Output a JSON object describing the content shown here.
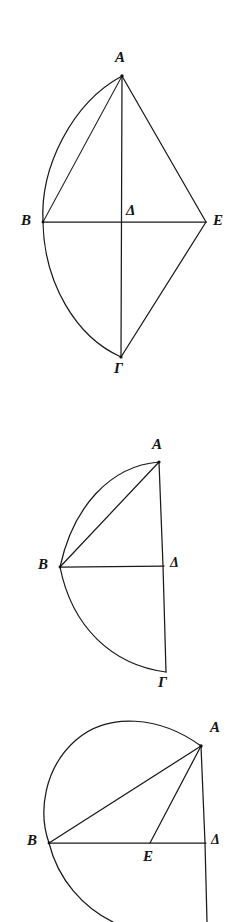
{
  "plate": {
    "background_color": "#ffffff",
    "ink_color": "#1a1a1a",
    "width": 243,
    "height": 922,
    "figure_count": 3
  },
  "figures": [
    {
      "id": "figure-1",
      "description": "Lens/kite construction: circular segment arc B-A and B-Gamma on the left, straight chords A-B, A-E, E-Gamma on the right, with horizontal diameter B-E and vertical axis A-Delta-Gamma crossing at Delta.",
      "labels": [
        {
          "key": "A",
          "text": "A",
          "x": 115,
          "y": 50
        },
        {
          "key": "B",
          "text": "B",
          "x": 21,
          "y": 213
        },
        {
          "key": "D",
          "text": "Δ",
          "x": 126,
          "y": 203
        },
        {
          "key": "E",
          "text": "E",
          "x": 213,
          "y": 213
        },
        {
          "key": "G",
          "text": "Γ",
          "x": 114,
          "y": 361
        }
      ],
      "points": {
        "A": {
          "x": 122,
          "y": 76
        },
        "B": {
          "x": 43,
          "y": 222
        },
        "D": {
          "x": 122,
          "y": 222
        },
        "E": {
          "x": 206,
          "y": 222
        },
        "G": {
          "x": 121,
          "y": 357
        }
      }
    },
    {
      "id": "figure-2",
      "description": "Right-hand half figure: arc sweeping from A leftwards through B down to Gamma, vertical line A-Delta-Gamma on the right, horizontal radius B-Delta, and chord B-A.",
      "labels": [
        {
          "key": "A",
          "text": "A",
          "x": 152,
          "y": 437
        },
        {
          "key": "B",
          "text": "B",
          "x": 38,
          "y": 557
        },
        {
          "key": "D",
          "text": "Δ",
          "x": 170,
          "y": 556
        },
        {
          "key": "G",
          "text": "Γ",
          "x": 158,
          "y": 675
        }
      ],
      "points": {
        "A": {
          "x": 159,
          "y": 462
        },
        "B": {
          "x": 60,
          "y": 567
        },
        "D": {
          "x": 164,
          "y": 566
        },
        "G": {
          "x": 166,
          "y": 672
        }
      }
    },
    {
      "id": "figure-3",
      "description": "Circle with chord B-A, chord A-E, horizontal line B-E-Delta and the vertical line through A and Delta continuing below the horizontal.",
      "labels": [
        {
          "key": "A",
          "text": "A",
          "x": 210,
          "y": 720
        },
        {
          "key": "B",
          "text": "B",
          "x": 27,
          "y": 833
        },
        {
          "key": "E",
          "text": "E",
          "x": 143,
          "y": 849
        },
        {
          "key": "D",
          "text": "Δ",
          "x": 211,
          "y": 833
        }
      ],
      "points": {
        "A": {
          "x": 201,
          "y": 746
        },
        "B": {
          "x": 49,
          "y": 843
        },
        "E": {
          "x": 150,
          "y": 843
        },
        "D": {
          "x": 206,
          "y": 843
        }
      }
    }
  ]
}
